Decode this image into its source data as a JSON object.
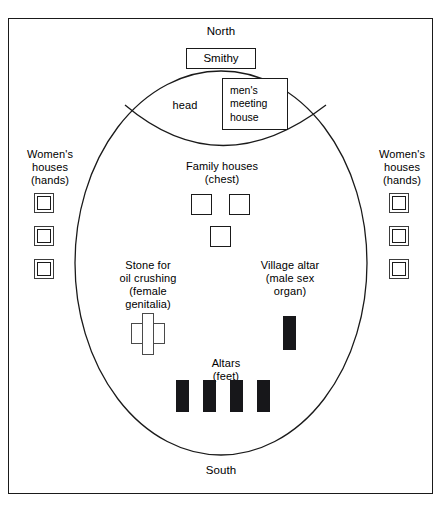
{
  "diagram": {
    "frame": {
      "shape": "rectangle"
    },
    "compass": {
      "north_label": "North",
      "south_label": "South"
    },
    "enclosure": {
      "shape": "oval",
      "lens_region_label": "head"
    },
    "structures": {
      "smithy": {
        "label": "Smithy",
        "shape": "open-rectangle"
      },
      "mens_meeting_house": {
        "label": "men's\nmeeting\nhouse",
        "shape": "open-rectangle"
      },
      "family_houses": {
        "label": "Family houses\n(chest)",
        "count": 3,
        "shape": "open-square"
      },
      "women_houses_left": {
        "label": "Women's\nhouses\n(hands)",
        "count": 3,
        "shape": "double-square"
      },
      "women_houses_right": {
        "label": "Women's\nhouses\n(hands)",
        "count": 3,
        "shape": "double-square"
      },
      "oil_crushing_stone": {
        "label": "Stone for\noil crushing\n(female\ngenitalia)",
        "shape": "cross-stone"
      },
      "village_altar": {
        "label": "Village altar\n(male sex\norgan)",
        "count": 1,
        "shape": "filled-rectangle"
      },
      "altars_feet": {
        "label": "Altars\n(feet)",
        "count": 4,
        "shape": "filled-rectangle"
      }
    },
    "colors": {
      "ink": "#1a1a1a",
      "fill_dark": "#17171a",
      "paper": "#ffffff"
    }
  }
}
